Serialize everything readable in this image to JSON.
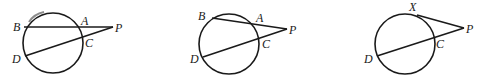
{
  "figures": [
    {
      "id": "figure-1",
      "description": "Two secants from external point P",
      "labels": {
        "B": "B",
        "A": "A",
        "P": "P",
        "C": "C",
        "D": "D"
      },
      "segments": [
        "B-P",
        "D-P"
      ],
      "highlighted_arc": "arc near B (gray)"
    },
    {
      "id": "figure-2",
      "description": "Two secants from external point P",
      "labels": {
        "B": "B",
        "A": "A",
        "P": "P",
        "C": "C",
        "D": "D"
      },
      "segments": [
        "B-P",
        "D-P"
      ]
    },
    {
      "id": "figure-3",
      "description": "Tangent and secant from external point P",
      "labels": {
        "X": "X",
        "P": "P",
        "C": "C",
        "D": "D"
      },
      "segments": [
        "X-P",
        "D-P"
      ]
    }
  ],
  "colors": {
    "stroke": "#1a1a1a",
    "arc_mark": "#8c8c8c",
    "background": "#ffffff"
  }
}
